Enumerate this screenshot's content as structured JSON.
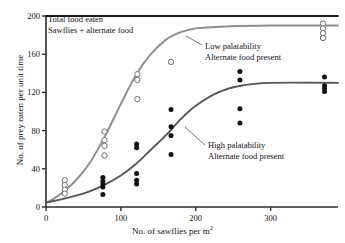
{
  "figure": {
    "kind": "scatter-with-fitted-curves",
    "background": "#ffffff"
  },
  "axes": {
    "y_label": "No. of prey eaten per unit time",
    "x_label_text": "No. of sawflies per m",
    "x_label_exponent": "2",
    "y_ticks": [
      0,
      40,
      80,
      120,
      160,
      200
    ],
    "x_ticks": [
      0,
      100,
      200,
      300
    ]
  },
  "annotations": {
    "total": {
      "line1": "Total food eaten",
      "line2": "Sawflies + alternate food"
    },
    "low": {
      "line1": "Low palatability",
      "line2": "Alternate food present"
    },
    "high": {
      "line1": "High palatability",
      "line2": "Alternate food present"
    }
  },
  "colors": {
    "total_line": "#1a1a1a",
    "low_curve": "#8d8d8d",
    "high_curve": "#575757",
    "open_marker_stroke": "#6f6f6f",
    "filled_marker": "#111111",
    "axis": "#2b2b2b"
  },
  "chart_data": {
    "type": "scatter",
    "title": "",
    "xlabel": "No. of sawflies per m^2",
    "ylabel": "No. of prey eaten per unit time",
    "xlim": [
      0,
      390
    ],
    "ylim": [
      0,
      200
    ],
    "grid": false,
    "legend": "inline-annotations",
    "series": [
      {
        "name": "Total food eaten (Sawflies + alternate food)",
        "style": "line",
        "marker": "none",
        "color": "#1a1a1a",
        "x": [
          0,
          20,
          60,
          120,
          200,
          300,
          390
        ],
        "y": [
          200,
          200,
          200,
          200,
          200,
          200,
          200
        ]
      },
      {
        "name": "Low palatability, alternate food present",
        "style": "curve+open-circles",
        "marker": "open-circle",
        "color": "#8d8d8d",
        "curve_x": [
          2,
          20,
          40,
          60,
          80,
          100,
          120,
          140,
          160,
          180,
          200,
          240,
          300,
          390
        ],
        "curve_y": [
          5,
          14,
          28,
          48,
          76,
          108,
          138,
          160,
          175,
          183,
          187,
          189,
          190,
          190
        ],
        "points": [
          {
            "x": 25,
            "y": 28
          },
          {
            "x": 25,
            "y": 23
          },
          {
            "x": 25,
            "y": 18
          },
          {
            "x": 25,
            "y": 14
          },
          {
            "x": 78,
            "y": 79
          },
          {
            "x": 78,
            "y": 70
          },
          {
            "x": 78,
            "y": 64
          },
          {
            "x": 78,
            "y": 54
          },
          {
            "x": 122,
            "y": 139
          },
          {
            "x": 122,
            "y": 133
          },
          {
            "x": 122,
            "y": 113
          },
          {
            "x": 167,
            "y": 152
          },
          {
            "x": 370,
            "y": 192
          },
          {
            "x": 370,
            "y": 187
          },
          {
            "x": 370,
            "y": 182
          },
          {
            "x": 370,
            "y": 177
          }
        ]
      },
      {
        "name": "High palatability, alternate food present",
        "style": "curve+filled-circles",
        "marker": "filled-circle",
        "color": "#575757",
        "curve_x": [
          2,
          20,
          40,
          60,
          80,
          100,
          120,
          140,
          160,
          180,
          200,
          230,
          260,
          300,
          390
        ],
        "curve_y": [
          5,
          8,
          12,
          17,
          24,
          33,
          45,
          60,
          75,
          92,
          106,
          120,
          127,
          130,
          130
        ],
        "points": [
          {
            "x": 76,
            "y": 31
          },
          {
            "x": 76,
            "y": 27
          },
          {
            "x": 76,
            "y": 24
          },
          {
            "x": 76,
            "y": 21
          },
          {
            "x": 76,
            "y": 13
          },
          {
            "x": 121,
            "y": 66
          },
          {
            "x": 121,
            "y": 62
          },
          {
            "x": 121,
            "y": 35
          },
          {
            "x": 121,
            "y": 28
          },
          {
            "x": 121,
            "y": 24
          },
          {
            "x": 167,
            "y": 102
          },
          {
            "x": 167,
            "y": 84
          },
          {
            "x": 167,
            "y": 75
          },
          {
            "x": 167,
            "y": 55
          },
          {
            "x": 259,
            "y": 142
          },
          {
            "x": 259,
            "y": 133
          },
          {
            "x": 259,
            "y": 103
          },
          {
            "x": 259,
            "y": 88
          },
          {
            "x": 372,
            "y": 136
          },
          {
            "x": 372,
            "y": 127
          },
          {
            "x": 372,
            "y": 124
          },
          {
            "x": 372,
            "y": 121
          }
        ]
      }
    ]
  }
}
